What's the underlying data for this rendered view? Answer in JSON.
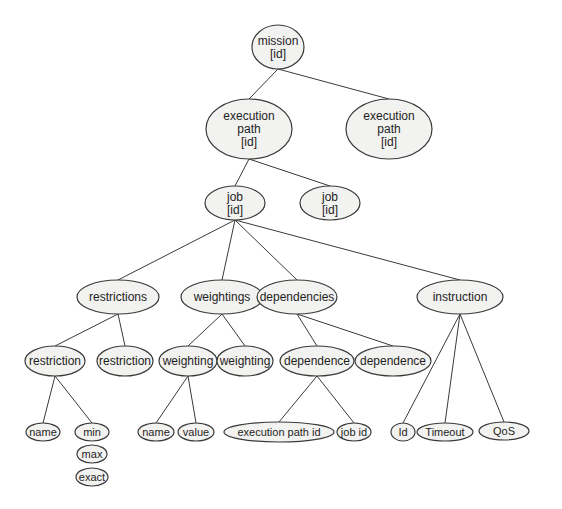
{
  "diagram": {
    "type": "tree",
    "colors": {
      "node_fill": "#f2f2f0",
      "stroke": "#3a3a3a",
      "text": "#1e1e1e",
      "background": "#ffffff"
    },
    "nodes": [
      {
        "id": "mission",
        "lines": [
          "mission",
          "[id]"
        ],
        "cx": 278,
        "cy": 47,
        "rx": 26,
        "ry": 22
      },
      {
        "id": "execution-path-1",
        "lines": [
          "execution",
          "path",
          "[id]"
        ],
        "cx": 249,
        "cy": 129,
        "rx": 43,
        "ry": 30
      },
      {
        "id": "execution-path-2",
        "lines": [
          "execution",
          "path",
          "[id]"
        ],
        "cx": 389,
        "cy": 129,
        "rx": 43,
        "ry": 30
      },
      {
        "id": "job-1",
        "lines": [
          "job",
          "[id]"
        ],
        "cx": 235,
        "cy": 203,
        "rx": 30,
        "ry": 17
      },
      {
        "id": "job-2",
        "lines": [
          "job",
          "[id]"
        ],
        "cx": 330,
        "cy": 203,
        "rx": 30,
        "ry": 17
      },
      {
        "id": "restrictions",
        "lines": [
          "restrictions"
        ],
        "cx": 118,
        "cy": 297,
        "rx": 41,
        "ry": 17
      },
      {
        "id": "weightings",
        "lines": [
          "weightings"
        ],
        "cx": 222,
        "cy": 297,
        "rx": 41,
        "ry": 17
      },
      {
        "id": "dependencies",
        "lines": [
          "dependencies"
        ],
        "cx": 297,
        "cy": 297,
        "rx": 40,
        "ry": 17
      },
      {
        "id": "instruction",
        "lines": [
          "instruction"
        ],
        "cx": 460,
        "cy": 297,
        "rx": 43,
        "ry": 17
      },
      {
        "id": "restriction-1",
        "lines": [
          "restriction"
        ],
        "cx": 55,
        "cy": 361,
        "rx": 30,
        "ry": 15
      },
      {
        "id": "restriction-2",
        "lines": [
          "restriction"
        ],
        "cx": 125,
        "cy": 361,
        "rx": 28,
        "ry": 15
      },
      {
        "id": "weighting-1",
        "lines": [
          "weighting"
        ],
        "cx": 188,
        "cy": 361,
        "rx": 29,
        "ry": 15
      },
      {
        "id": "weighting-2",
        "lines": [
          "weighting"
        ],
        "cx": 245,
        "cy": 361,
        "rx": 28,
        "ry": 15
      },
      {
        "id": "dependence-1",
        "lines": [
          "dependence"
        ],
        "cx": 317,
        "cy": 361,
        "rx": 37,
        "ry": 15
      },
      {
        "id": "dependence-2",
        "lines": [
          "dependence"
        ],
        "cx": 393,
        "cy": 361,
        "rx": 38,
        "ry": 15
      },
      {
        "id": "restriction-name",
        "lines": [
          "name"
        ],
        "cx": 43,
        "cy": 432,
        "rx": 17,
        "ry": 9
      },
      {
        "id": "restriction-min",
        "lines": [
          "min"
        ],
        "cx": 92,
        "cy": 432,
        "rx": 17,
        "ry": 9
      },
      {
        "id": "restriction-max",
        "lines": [
          "max"
        ],
        "cx": 92,
        "cy": 454,
        "rx": 15,
        "ry": 9
      },
      {
        "id": "restriction-exact",
        "lines": [
          "exact"
        ],
        "cx": 92,
        "cy": 477,
        "rx": 16,
        "ry": 9
      },
      {
        "id": "weighting-name",
        "lines": [
          "name"
        ],
        "cx": 156,
        "cy": 432,
        "rx": 18,
        "ry": 9
      },
      {
        "id": "weighting-value",
        "lines": [
          "value"
        ],
        "cx": 196,
        "cy": 432,
        "rx": 18,
        "ry": 9
      },
      {
        "id": "dependence-execution-path-id",
        "lines": [
          "execution path id"
        ],
        "cx": 279,
        "cy": 432,
        "rx": 55,
        "ry": 10
      },
      {
        "id": "dependence-job-id",
        "lines": [
          "job id"
        ],
        "cx": 354,
        "cy": 432,
        "rx": 17,
        "ry": 9
      },
      {
        "id": "instruction-id",
        "lines": [
          "Id"
        ],
        "cx": 403,
        "cy": 432,
        "rx": 12,
        "ry": 9
      },
      {
        "id": "instruction-timeout",
        "lines": [
          "Timeout"
        ],
        "cx": 445,
        "cy": 432,
        "rx": 28,
        "ry": 9
      },
      {
        "id": "instruction-qos",
        "lines": [
          "QoS"
        ],
        "cx": 504,
        "cy": 431,
        "rx": 25,
        "ry": 9
      }
    ],
    "edges": [
      [
        "mission",
        "execution-path-1"
      ],
      [
        "mission",
        "execution-path-2"
      ],
      [
        "execution-path-1",
        "job-1"
      ],
      [
        "execution-path-1",
        "job-2"
      ],
      [
        "job-1",
        "restrictions"
      ],
      [
        "job-1",
        "weightings"
      ],
      [
        "job-1",
        "dependencies"
      ],
      [
        "job-1",
        "instruction"
      ],
      [
        "restrictions",
        "restriction-1"
      ],
      [
        "restrictions",
        "restriction-2"
      ],
      [
        "weightings",
        "weighting-1"
      ],
      [
        "weightings",
        "weighting-2"
      ],
      [
        "dependencies",
        "dependence-1"
      ],
      [
        "dependencies",
        "dependence-2"
      ],
      [
        "restriction-1",
        "restriction-name"
      ],
      [
        "restriction-1",
        "restriction-min"
      ],
      [
        "weighting-1",
        "weighting-name"
      ],
      [
        "weighting-1",
        "weighting-value"
      ],
      [
        "dependence-1",
        "dependence-execution-path-id"
      ],
      [
        "dependence-1",
        "dependence-job-id"
      ],
      [
        "instruction",
        "instruction-id"
      ],
      [
        "instruction",
        "instruction-timeout"
      ],
      [
        "instruction",
        "instruction-qos"
      ]
    ]
  }
}
